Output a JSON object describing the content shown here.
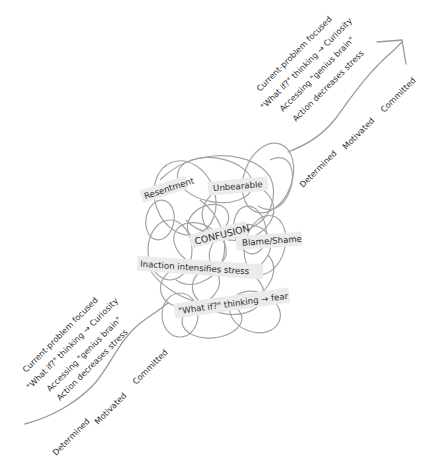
{
  "diagram": {
    "colors": {
      "line": "#9a9a9a",
      "tangle": "#a4a4a4",
      "label_bg": "#ebebeb",
      "text": "#2e2e2e",
      "background": "#ffffff"
    },
    "start_section": {
      "items": [
        "Current-problem focused",
        "\"What if?\" thinking → Curiosity",
        "Accessing \"genius brain\"",
        "Action decreases stress"
      ],
      "states": [
        "Determined",
        "Motivated",
        "Committed"
      ]
    },
    "tangle": {
      "labels": {
        "resentment": "Resentment",
        "unbearable": "Unbearable",
        "confusion": "CONFUSION",
        "blame_shame": "Blame/Shame",
        "inaction": "Inaction intensifies stress",
        "what_if_fear": "\"What if?\" thinking → fear"
      }
    },
    "end_section": {
      "items": [
        "Current-problem focused",
        "\"What if?\" thinking → Curiosity",
        "Accessing \"genius brain\"",
        "Action decreases stress"
      ],
      "states": [
        "Determined",
        "Motivated",
        "Committed"
      ],
      "arrow": "arrow-up-right"
    }
  }
}
